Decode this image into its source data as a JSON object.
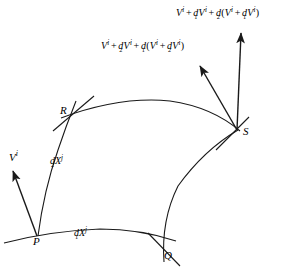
{
  "figure": {
    "kind": "differential-geometry-diagram",
    "background_color": "#ffffff",
    "ink_color": "#1a1a1a",
    "width": 306,
    "height": 267
  },
  "points": [
    {
      "id": "P",
      "label": "P",
      "x": 37,
      "y": 238
    },
    {
      "id": "Q",
      "label": "Q",
      "x": 168,
      "y": 255
    },
    {
      "id": "R",
      "label": "R",
      "x": 66,
      "y": 113
    },
    {
      "id": "S",
      "label": "S",
      "x": 238,
      "y": 131
    }
  ],
  "coordinate_labels": [
    {
      "id": "dX1",
      "base": "dX",
      "superscript": "j",
      "subscript": "1",
      "text": "dX^j_1",
      "x": 75,
      "y": 230,
      "describes": "edge P to Q"
    },
    {
      "id": "dX2",
      "base": "dX",
      "superscript": "j",
      "subscript": "2",
      "text": "dX^j_2",
      "x": 50,
      "y": 158,
      "describes": "edge P to R"
    }
  ],
  "vectors": [
    {
      "id": "V-at-P",
      "label_text": "V^i",
      "base": "V",
      "superscript": "i",
      "subscript": "",
      "origin": {
        "x": 37,
        "y": 236
      },
      "tip": {
        "x": 12,
        "y": 170
      },
      "label_x": 9,
      "label_y": 152
    },
    {
      "id": "V-transported-via-R",
      "origin": {
        "x": 237,
        "y": 130
      },
      "tip": {
        "x": 199,
        "y": 65
      },
      "label_id": "expr-via-R"
    },
    {
      "id": "V-transported-via-Q",
      "origin": {
        "x": 237,
        "y": 130
      },
      "tip": {
        "x": 241,
        "y": 32
      },
      "label_id": "expr-via-Q"
    }
  ],
  "expressions": [
    {
      "id": "expr-via-Q",
      "x": 176,
      "y": 7,
      "plain_text": "V^i + d_1 V^i + d_2 ( V^i + d_1 V^i )",
      "tokens": [
        {
          "kind": "var",
          "base": "V",
          "sup": "i"
        },
        {
          "kind": "op",
          "text": "+"
        },
        {
          "kind": "dop",
          "base": "d",
          "sub": "1"
        },
        {
          "kind": "var",
          "base": "V",
          "sup": "i"
        },
        {
          "kind": "op",
          "text": "+"
        },
        {
          "kind": "dop",
          "base": "d",
          "sub": "2"
        },
        {
          "kind": "paren",
          "text": "("
        },
        {
          "kind": "var",
          "base": "V",
          "sup": "i"
        },
        {
          "kind": "op",
          "text": "+"
        },
        {
          "kind": "dop",
          "base": "d",
          "sub": "1"
        },
        {
          "kind": "var",
          "base": "V",
          "sup": "i"
        },
        {
          "kind": "paren",
          "text": ")"
        }
      ]
    },
    {
      "id": "expr-via-R",
      "x": 101,
      "y": 40,
      "plain_text": "V^i + d_2 V^i + d_1 ( V^i + d_2 V^i )",
      "tokens": [
        {
          "kind": "var",
          "base": "V",
          "sup": "i"
        },
        {
          "kind": "op",
          "text": "+"
        },
        {
          "kind": "dop",
          "base": "d",
          "sub": "2"
        },
        {
          "kind": "var",
          "base": "V",
          "sup": "i"
        },
        {
          "kind": "op",
          "text": "+"
        },
        {
          "kind": "dop",
          "base": "d",
          "sub": "1"
        },
        {
          "kind": "paren",
          "text": "("
        },
        {
          "kind": "var",
          "base": "V",
          "sup": "i"
        },
        {
          "kind": "op",
          "text": "+"
        },
        {
          "kind": "dop",
          "base": "d",
          "sub": "2"
        },
        {
          "kind": "var",
          "base": "V",
          "sup": "i"
        },
        {
          "kind": "paren",
          "text": ")"
        }
      ]
    }
  ]
}
